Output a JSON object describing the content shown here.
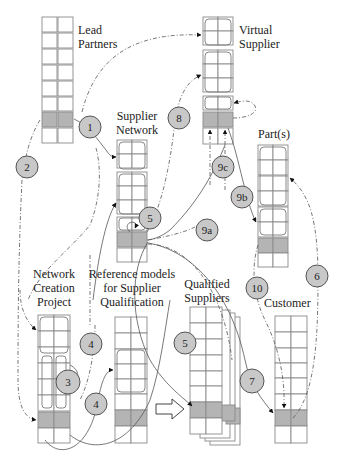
{
  "diagram": {
    "type": "process-flow",
    "title": "",
    "colors": {
      "cell_fill": "#ffffff",
      "cell_highlight": "#b4b4b4",
      "cell_border": "#8a8a8a",
      "step_circle_fill": "#c8c8c8",
      "line": "#555555"
    },
    "nodes": [
      {
        "id": "lead_partners",
        "label_line1": "Lead",
        "label_line2": "Partners",
        "label_line3": ""
      },
      {
        "id": "virtual_supplier",
        "label_line1": "Virtual",
        "label_line2": "Supplier",
        "label_line3": ""
      },
      {
        "id": "supplier_network",
        "label_line1": "Supplier",
        "label_line2": "Network",
        "label_line3": ""
      },
      {
        "id": "parts",
        "label_line1": "Part(s)",
        "label_line2": "",
        "label_line3": ""
      },
      {
        "id": "network_creation_project",
        "label_line1": "Network",
        "label_line2": "Creation",
        "label_line3": "Project"
      },
      {
        "id": "reference_models",
        "label_line1": "Reference models",
        "label_line2": "for Supplier",
        "label_line3": "Qualification"
      },
      {
        "id": "qualified_suppliers",
        "label_line1": "Qualified",
        "label_line2": "Suppliers",
        "label_line3": ""
      },
      {
        "id": "customer",
        "label_line1": "Customer",
        "label_line2": "",
        "label_line3": ""
      }
    ],
    "steps": [
      {
        "label": "1",
        "from": "lead_partners",
        "to": "supplier_network"
      },
      {
        "label": "2",
        "from": "lead_partners",
        "to": "network_creation_project"
      },
      {
        "label": "3",
        "from": "network_creation_project",
        "to": "network_creation_project"
      },
      {
        "label": "4",
        "from": "network_creation_project",
        "to": "reference_models"
      },
      {
        "label": "4",
        "from": "network_creation_project",
        "to": "supplier_network"
      },
      {
        "label": "5",
        "from": "supplier_network",
        "to": "supplier_network"
      },
      {
        "label": "5",
        "from": "supplier_network",
        "to": "qualified_suppliers"
      },
      {
        "label": "6",
        "from": "customer",
        "to": "parts"
      },
      {
        "label": "7",
        "from": "supplier_network",
        "to": "customer"
      },
      {
        "label": "8",
        "from": "supplier_network",
        "to": "virtual_supplier"
      },
      {
        "label": "9a",
        "from": "supplier_network",
        "to": "virtual_supplier"
      },
      {
        "label": "9b",
        "from": "virtual_supplier",
        "to": "parts"
      },
      {
        "label": "9c",
        "from": "virtual_supplier",
        "to": "virtual_supplier"
      },
      {
        "label": "10",
        "from": "parts",
        "to": "customer"
      }
    ],
    "block_arrow": {
      "from": "reference_models",
      "to": "qualified_suppliers",
      "icon": "block-arrow-right-icon"
    }
  }
}
